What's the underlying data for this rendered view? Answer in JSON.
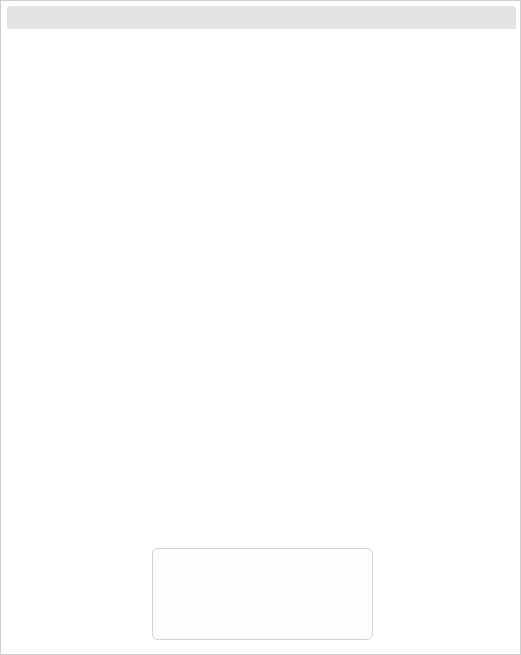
{
  "axes": {
    "y_title": "Systolic blood pressure (mmHg)",
    "x_title": "cholesterol",
    "mgdl_label": "mg/dL",
    "mmol_label": "mmol/L",
    "mgdl_ticks": [
      "200",
      "250",
      "300"
    ],
    "mmol_ticks": [
      "5",
      "6",
      "7",
      "8"
    ],
    "sbp_ticks": [
      "180",
      "160",
      "140",
      "120"
    ]
  },
  "panels": [
    {
      "title": "Women",
      "smoking": [
        "nonsmoker",
        "smoker"
      ]
    },
    {
      "title": "Men",
      "smoking": [
        "nonsmoker",
        "smoker"
      ]
    }
  ],
  "age_labels": [
    "age",
    "70",
    "60",
    "50",
    "40",
    "30"
  ],
  "ages": [
    "70",
    "60",
    "50",
    "40",
    "30"
  ],
  "legend": {
    "title": "Risk level*",
    "rows": [
      {
        "name": "very high",
        "range": ">40%",
        "color": "#b7b7b7"
      },
      {
        "name": "high",
        "range": "20–40%",
        "color": "#d8d8d8"
      },
      {
        "name": "moderate",
        "range": "10–20%",
        "color": "#a0a0a0"
      },
      {
        "name": "mild",
        "range": "5–10%",
        "color": "#c9c9c9"
      },
      {
        "name": "low",
        "range": "<5%",
        "color": "#ffffff"
      }
    ]
  },
  "chart_data": {
    "type": "heatmap",
    "xlabel": "cholesterol",
    "ylabel": "Systolic blood pressure (mmHg)",
    "x_categories_mmol": [
      5,
      6,
      7,
      8
    ],
    "x_categories_mgdl": [
      200,
      250,
      300
    ],
    "y_categories": [
      180,
      160,
      140,
      120
    ],
    "risk_levels": [
      "low",
      "mild",
      "moderate",
      "high",
      "very high"
    ],
    "risk_ranges": [
      "<5%",
      "5–10%",
      "10–20%",
      "20–40%",
      ">40%"
    ],
    "legend_position": "bottom-center",
    "grid": true,
    "panels": [
      {
        "sex": "Women",
        "blocks": [
          {
            "age": "70",
            "smoking": "nonsmoker",
            "rows": [
              [
                "mod",
                "mod",
                "mild",
                "mild"
              ],
              [
                "mod",
                "mod",
                "mod",
                "mild"
              ],
              [
                "mod",
                "mod",
                "mod",
                "mod"
              ],
              [
                "mild",
                "mild",
                "mod",
                "mod"
              ]
            ]
          },
          {
            "age": "70",
            "smoking": "smoker",
            "rows": [
              [
                "mild",
                "mild",
                "mild",
                "mild"
              ],
              [
                "mod",
                "mild",
                "mild",
                "mild"
              ],
              [
                "mod",
                "mod",
                "mild",
                "mild"
              ],
              [
                "mod",
                "mod",
                "mod",
                "mild"
              ]
            ]
          },
          {
            "age": "60",
            "smoking": "nonsmoker",
            "rows": [
              [
                "mod",
                "mod",
                "mod",
                "mild"
              ],
              [
                "mod",
                "mod",
                "mod",
                "mod"
              ],
              [
                "mild",
                "mod",
                "mod",
                "mod"
              ],
              [
                "mild",
                "mild",
                "mod",
                "mod"
              ]
            ]
          },
          {
            "age": "60",
            "smoking": "smoker",
            "rows": [
              [
                "mod",
                "mild",
                "mild",
                "mild"
              ],
              [
                "mod",
                "mod",
                "mild",
                "mild"
              ],
              [
                "mod",
                "mod",
                "mild",
                "mild"
              ],
              [
                "mod",
                "mod",
                "mod",
                "mod"
              ]
            ]
          },
          {
            "age": "50",
            "smoking": "nonsmoker",
            "rows": [
              [
                "mod",
                "mod",
                "mod",
                "mod"
              ],
              [
                "mod",
                "mod",
                "mod",
                "mod"
              ],
              [
                "mod",
                "mod",
                "mod",
                "mod"
              ],
              [
                "mild",
                "mild",
                "mod",
                "mod"
              ]
            ]
          },
          {
            "age": "50",
            "smoking": "smoker",
            "rows": [
              [
                "mod",
                "mod",
                "mild",
                "mild"
              ],
              [
                "mod",
                "mod",
                "mod",
                "mod"
              ],
              [
                "mod",
                "mod",
                "mod",
                "mod"
              ],
              [
                "mild",
                "mild",
                "mod",
                "mod"
              ]
            ]
          },
          {
            "age": "40",
            "smoking": "nonsmoker",
            "rows": [
              [
                "mild",
                "mild",
                "mild",
                "mild"
              ],
              [
                "low",
                "mild",
                "mild",
                "mild"
              ],
              [
                "low",
                "low",
                "mild",
                "mild"
              ],
              [
                "low",
                "low",
                "low",
                "low"
              ]
            ]
          },
          {
            "age": "40",
            "smoking": "smoker",
            "rows": [
              [
                "mild",
                "mild",
                "mod",
                "mod"
              ],
              [
                "mild",
                "mild",
                "mild",
                "mild"
              ],
              [
                "mild",
                "mild",
                "mild",
                "mild"
              ],
              [
                "low",
                "mild",
                "mild",
                "mild"
              ]
            ]
          },
          {
            "age": "30",
            "smoking": "nonsmoker",
            "rows": [
              [
                "low",
                "low",
                "low",
                "low"
              ],
              [
                "low",
                "low",
                "low",
                "low"
              ],
              [
                "low",
                "low",
                "low",
                "low"
              ],
              [
                "low",
                "low",
                "low",
                "low"
              ]
            ]
          },
          {
            "age": "30",
            "smoking": "smoker",
            "rows": [
              [
                "low",
                "low",
                "low",
                "low"
              ],
              [
                "low",
                "low",
                "low",
                "low"
              ],
              [
                "low",
                "low",
                "low",
                "low"
              ],
              [
                "low",
                "low",
                "low",
                "low"
              ]
            ]
          }
        ]
      },
      {
        "sex": "Men",
        "blocks": [
          {
            "age": "70",
            "smoking": "nonsmoker",
            "rows": [
              [
                "mild",
                "mild",
                "mild",
                "mild"
              ],
              [
                "mild",
                "mild",
                "mild",
                "mild"
              ],
              [
                "mild",
                "mild",
                "mild",
                "mild"
              ],
              [
                "mod",
                "mild",
                "mild",
                "mild"
              ]
            ]
          },
          {
            "age": "70",
            "smoking": "smoker",
            "rows": [
              [
                "mild",
                "mild",
                "mild",
                "mild"
              ],
              [
                "mild",
                "mild",
                "mild",
                "mild"
              ],
              [
                "mild",
                "mild",
                "mild",
                "mild"
              ],
              [
                "mild",
                "mild",
                "mild",
                "mild"
              ]
            ]
          },
          {
            "age": "60",
            "smoking": "nonsmoker",
            "rows": [
              [
                "mild",
                "mild",
                "mild",
                "mild"
              ],
              [
                "mod",
                "mild",
                "mild",
                "mild"
              ],
              [
                "mod",
                "mild",
                "mild",
                "mild"
              ],
              [
                "mod",
                "mod",
                "mod",
                "mild"
              ]
            ]
          },
          {
            "age": "60",
            "smoking": "smoker",
            "rows": [
              [
                "mild",
                "mild",
                "mild",
                "mild"
              ],
              [
                "mild",
                "mild",
                "mild",
                "mild"
              ],
              [
                "mild",
                "mild",
                "mild",
                "mild"
              ],
              [
                "mod",
                "mild",
                "mild",
                "mild"
              ]
            ]
          },
          {
            "age": "50",
            "smoking": "nonsmoker",
            "rows": [
              [
                "mod",
                "mod",
                "mild",
                "mild"
              ],
              [
                "mod",
                "mod",
                "mod",
                "mod"
              ],
              [
                "mod",
                "mod",
                "mod",
                "mod"
              ],
              [
                "mild",
                "mod",
                "mod",
                "mod"
              ]
            ]
          },
          {
            "age": "50",
            "smoking": "smoker",
            "rows": [
              [
                "mild",
                "mild",
                "mild",
                "mild"
              ],
              [
                "mod",
                "mild",
                "mild",
                "mild"
              ],
              [
                "mild",
                "mild",
                "mild",
                "mild"
              ],
              [
                "mod",
                "mod",
                "mod",
                "mod"
              ]
            ]
          },
          {
            "age": "40",
            "smoking": "nonsmoker",
            "rows": [
              [
                "mild",
                "mod",
                "mod",
                "mod"
              ],
              [
                "mild",
                "mild",
                "mod",
                "mod"
              ],
              [
                "mild",
                "mild",
                "mild",
                "mod"
              ],
              [
                "mild",
                "mild",
                "mild",
                "mild"
              ]
            ]
          },
          {
            "age": "40",
            "smoking": "smoker",
            "rows": [
              [
                "mod",
                "mod",
                "mild",
                "mild"
              ],
              [
                "mod",
                "mod",
                "mod",
                "mild"
              ],
              [
                "mod",
                "mod",
                "mod",
                "mod"
              ],
              [
                "mild",
                "mild",
                "mod",
                "mod"
              ]
            ]
          },
          {
            "age": "30",
            "smoking": "nonsmoker",
            "rows": [
              [
                "low",
                "mild",
                "mild",
                "mild"
              ],
              [
                "low",
                "low",
                "mild",
                "mild"
              ],
              [
                "low",
                "low",
                "mild",
                "mild"
              ],
              [
                "low",
                "low",
                "low",
                "mild"
              ]
            ]
          },
          {
            "age": "30",
            "smoking": "smoker",
            "rows": [
              [
                "mild",
                "mild",
                "mod",
                "mod"
              ],
              [
                "mild",
                "mild",
                "mild",
                "mod"
              ],
              [
                "mild",
                "mild",
                "mild",
                "mild"
              ],
              [
                "low",
                "low",
                "mild",
                "mild"
              ]
            ]
          }
        ]
      }
    ]
  }
}
